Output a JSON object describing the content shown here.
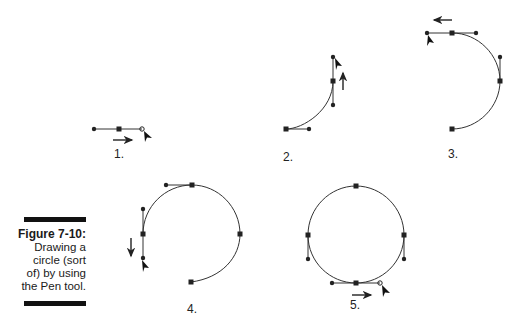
{
  "caption": {
    "title": "Figure 7-10:",
    "lines": [
      "Drawing a",
      "circle (sort",
      "of) by using",
      "the Pen tool."
    ]
  },
  "steps": [
    {
      "label": "1.",
      "description": "straight segment with anchor and handle, cursor dragging right"
    },
    {
      "label": "2.",
      "description": "quarter arc, vertical handle, cursor dragging up"
    },
    {
      "label": "3.",
      "description": "half circle, horizontal handle, cursor dragging left"
    },
    {
      "label": "4.",
      "description": "three-quarter circle, vertical handle, cursor dragging down"
    },
    {
      "label": "5.",
      "description": "closed circle, horizontal handle, cursor dragging right"
    }
  ],
  "colors": {
    "stroke": "#222222",
    "caption_bar": "#111111"
  }
}
